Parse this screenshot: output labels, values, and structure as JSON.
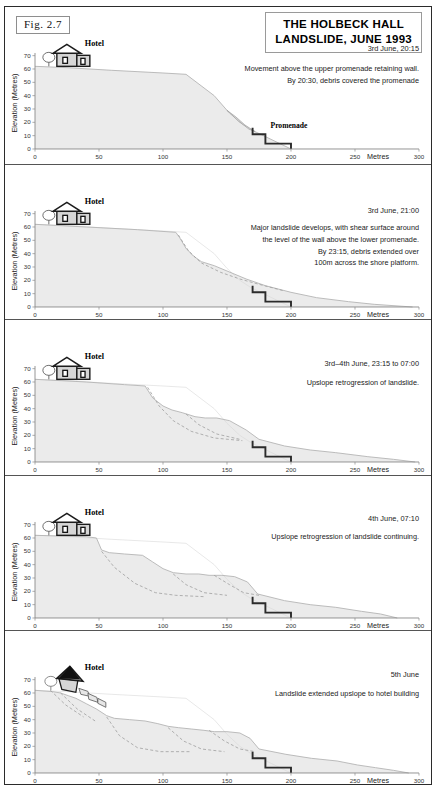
{
  "figure": {
    "fig_number": "Fig.  2.7",
    "title_line1": "THE HOLBECK HALL",
    "title_line2": "LANDSLIDE, JUNE 1993",
    "hotel_label": "Hotel",
    "promenade_label": "Promenade",
    "axis": {
      "y_title": "Elevation (Metres)",
      "y_ticks": [
        0,
        10,
        20,
        30,
        40,
        50,
        60,
        70
      ],
      "x_ticks": [
        0,
        50,
        100,
        150,
        200,
        250,
        300
      ],
      "x_unit": "Metres",
      "xlim": [
        0,
        300
      ],
      "ylim": [
        0,
        72
      ]
    },
    "colors": {
      "slope_fill": "#ebebeb",
      "slope_line": "#b4b4b4",
      "debris_fill": "#dcdcdc",
      "debris_line": "#9e9e9e",
      "promenade": "#2b2b2b",
      "frame": "#2b2b2b",
      "text": "#222222"
    }
  },
  "panels": [
    {
      "id": "panel-1",
      "date": "3rd June, 20:15",
      "note": "Movement above the upper promenade retaining wall.\nBy 20:30, debris covered the promenade",
      "hotel_state": "intact"
    },
    {
      "id": "panel-2",
      "date": "3rd June, 21:00",
      "note": "Major landslide develops, with shear surface around\nthe level of the wall above the lower promenade.\nBy 23:15, debris extended over\n100m across the shore platform.",
      "hotel_state": "intact"
    },
    {
      "id": "panel-3",
      "date": "3rd–4th June, 23:15 to 07:00",
      "note": "Upslope retrogression of landslide.",
      "hotel_state": "intact"
    },
    {
      "id": "panel-4",
      "date": "4th June, 07:10",
      "note": "Upslope retrogression of landslide continuing.",
      "hotel_state": "intact"
    },
    {
      "id": "panel-5",
      "date": "5th June",
      "note": "Landslide extended upslope to hotel building",
      "hotel_state": "collapsing"
    }
  ],
  "chart_data": {
    "type": "area",
    "title": "THE HOLBECK HALL LANDSLIDE, JUNE 1993",
    "xlabel": "Metres",
    "ylabel": "Elevation (Metres)",
    "xlim": [
      0,
      300
    ],
    "ylim": [
      0,
      72
    ],
    "xticks": [
      0,
      50,
      100,
      150,
      200,
      250,
      300
    ],
    "yticks": [
      0,
      10,
      20,
      30,
      40,
      50,
      60,
      70
    ],
    "grid": false,
    "legend": "none",
    "promenade_profile": [
      [
        170,
        16
      ],
      [
        170,
        11
      ],
      [
        180,
        11
      ],
      [
        180,
        4
      ],
      [
        200,
        4
      ],
      [
        200,
        0
      ]
    ],
    "series": [
      {
        "name": "panel-1 cliff profile (3rd June 20:15)",
        "points": [
          [
            0,
            62
          ],
          [
            25,
            61
          ],
          [
            60,
            59
          ],
          [
            100,
            57
          ],
          [
            118,
            56
          ],
          [
            140,
            40
          ],
          [
            150,
            29
          ],
          [
            160,
            20
          ],
          [
            168,
            15
          ],
          [
            172,
            13
          ],
          [
            200,
            0
          ]
        ]
      },
      {
        "name": "panel-1 debris lobe",
        "points": [
          [
            150,
            29
          ],
          [
            158,
            23
          ],
          [
            165,
            17
          ],
          [
            172,
            13
          ],
          [
            166,
            16
          ],
          [
            158,
            22
          ],
          [
            150,
            29
          ]
        ]
      },
      {
        "name": "panel-2 cliff profile (3rd June 21:00)",
        "points": [
          [
            0,
            62
          ],
          [
            40,
            60
          ],
          [
            80,
            58
          ],
          [
            110,
            56
          ],
          [
            113,
            52
          ],
          [
            118,
            44
          ],
          [
            124,
            38
          ],
          [
            130,
            34
          ],
          [
            140,
            31
          ],
          [
            150,
            27
          ],
          [
            165,
            21
          ],
          [
            180,
            16
          ],
          [
            200,
            11
          ],
          [
            220,
            7
          ],
          [
            245,
            4
          ],
          [
            265,
            2
          ],
          [
            295,
            0
          ]
        ]
      },
      {
        "name": "panel-2 shear surface (dashed)",
        "points": [
          [
            112,
            54
          ],
          [
            120,
            42
          ],
          [
            130,
            33
          ],
          [
            145,
            26
          ],
          [
            160,
            21
          ],
          [
            175,
            17
          ],
          [
            195,
            12
          ]
        ]
      },
      {
        "name": "panel-3 cliff profile (3rd-4th June 23:15-07:00)",
        "points": [
          [
            0,
            62
          ],
          [
            40,
            60
          ],
          [
            70,
            58
          ],
          [
            86,
            57
          ],
          [
            92,
            48
          ],
          [
            100,
            42
          ],
          [
            107,
            39
          ],
          [
            115,
            37
          ],
          [
            125,
            34
          ],
          [
            133,
            33
          ],
          [
            142,
            33
          ],
          [
            152,
            31
          ],
          [
            165,
            24
          ],
          [
            175,
            17
          ],
          [
            195,
            12
          ],
          [
            215,
            9
          ],
          [
            235,
            7
          ],
          [
            260,
            4
          ],
          [
            280,
            2
          ],
          [
            297,
            0
          ]
        ]
      },
      {
        "name": "panel-3 shear surfaces (dashed)",
        "points": [
          [
            88,
            56
          ],
          [
            97,
            42
          ],
          [
            108,
            31
          ],
          [
            122,
            23
          ],
          [
            140,
            18
          ],
          [
            160,
            16
          ],
          [
            118,
            36
          ],
          [
            130,
            27
          ],
          [
            145,
            21
          ],
          [
            160,
            17
          ]
        ]
      },
      {
        "name": "panel-4 cliff profile (4th June 07:10)",
        "points": [
          [
            0,
            62
          ],
          [
            40,
            61
          ],
          [
            48,
            60
          ],
          [
            52,
            51
          ],
          [
            58,
            49
          ],
          [
            70,
            48
          ],
          [
            84,
            47
          ],
          [
            92,
            42
          ],
          [
            100,
            37
          ],
          [
            108,
            34
          ],
          [
            118,
            33
          ],
          [
            128,
            33
          ],
          [
            136,
            32
          ],
          [
            146,
            32
          ],
          [
            156,
            31
          ],
          [
            166,
            27
          ],
          [
            174,
            18
          ],
          [
            195,
            13
          ],
          [
            215,
            10
          ],
          [
            235,
            8
          ],
          [
            255,
            5
          ],
          [
            270,
            3
          ],
          [
            283,
            0
          ]
        ]
      },
      {
        "name": "panel-4 shear surfaces (dashed)",
        "points": [
          [
            52,
            50
          ],
          [
            64,
            38
          ],
          [
            80,
            26
          ],
          [
            95,
            19
          ],
          [
            110,
            17
          ],
          [
            130,
            16
          ],
          [
            108,
            33
          ],
          [
            118,
            25
          ],
          [
            132,
            19
          ],
          [
            148,
            17
          ],
          [
            140,
            32
          ],
          [
            152,
            25
          ],
          [
            162,
            19
          ],
          [
            172,
            17
          ]
        ]
      },
      {
        "name": "panel-5 cliff profile (5th June)",
        "points": [
          [
            0,
            62
          ],
          [
            14,
            61
          ],
          [
            20,
            60
          ],
          [
            26,
            58
          ],
          [
            32,
            56
          ],
          [
            40,
            52
          ],
          [
            48,
            48
          ],
          [
            56,
            43
          ],
          [
            62,
            41
          ],
          [
            74,
            40
          ],
          [
            86,
            39
          ],
          [
            96,
            37
          ],
          [
            104,
            35
          ],
          [
            112,
            34
          ],
          [
            122,
            33
          ],
          [
            132,
            32
          ],
          [
            140,
            31
          ],
          [
            150,
            31
          ],
          [
            160,
            30
          ],
          [
            168,
            26
          ],
          [
            175,
            18
          ],
          [
            196,
            14
          ],
          [
            216,
            11
          ],
          [
            236,
            9
          ],
          [
            252,
            6
          ],
          [
            266,
            4
          ],
          [
            280,
            2
          ],
          [
            292,
            0
          ]
        ]
      },
      {
        "name": "panel-5 shear surfaces (dashed)",
        "points": [
          [
            12,
            62
          ],
          [
            26,
            50
          ],
          [
            40,
            41
          ],
          [
            20,
            60
          ],
          [
            34,
            47
          ],
          [
            48,
            39
          ],
          [
            56,
            42
          ],
          [
            68,
            27
          ],
          [
            82,
            18
          ],
          [
            100,
            16
          ],
          [
            120,
            16
          ],
          [
            104,
            34
          ],
          [
            116,
            24
          ],
          [
            130,
            18
          ],
          [
            146,
            16
          ],
          [
            136,
            32
          ],
          [
            148,
            24
          ],
          [
            160,
            18
          ],
          [
            170,
            16
          ]
        ]
      }
    ]
  }
}
